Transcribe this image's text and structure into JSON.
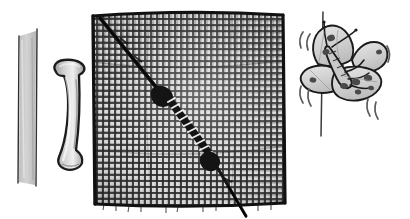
{
  "illustration": {
    "title": "Window screen repair with mesh, spline and butterfly",
    "style": "hand-drawn pen and ink with grayscale wash",
    "background_color": "#ffffff",
    "ink_color": "#1a1a1a",
    "canvas": {
      "width": 410,
      "height": 219
    }
  },
  "objects": {
    "spline_strip": {
      "name": "Spline strip",
      "label": "spline-strip",
      "description": "Narrow vertical flat strip with gray wash fill at far left",
      "fill_color": "#b9b9b9",
      "outline_color": "#2b2b2b",
      "x": 16,
      "y": 32,
      "width": 22,
      "height": 152
    },
    "spline_piece": {
      "name": "Curved spline piece",
      "label": "spline-curved-piece",
      "description": "Bent rubber spline / handle shaped like a curved bracket",
      "fill_color": "#c6c6c6",
      "highlight_color": "#e8e8e8",
      "outline_color": "#1e1e1e",
      "x": 52,
      "y": 60,
      "width": 34,
      "height": 110
    },
    "mesh_panel": {
      "name": "Screen mesh panel",
      "label": "mesh-screen-panel",
      "description": "Square woven insect screen mesh with fine grid weave",
      "mesh_color": "#2a2a2a",
      "gap_color": "#d7d7d7",
      "border_color": "#111111",
      "x": 92,
      "y": 13,
      "width": 192,
      "height": 192,
      "grid_pitch_px": 6,
      "columns": 32,
      "rows": 32
    },
    "repair_thread": {
      "name": "Repair thread and needle",
      "label": "repair-thread-stitch",
      "description": "Dark diagonal thread stitched through the mesh from upper-left to lower-right with whipped zigzag stitching at the middle",
      "thread_color": "#111111",
      "stitch_highlight_color": "#f2f2f2",
      "start_x": 100,
      "start_y": 18,
      "end_x": 246,
      "end_y": 216
    },
    "hanging_wire": {
      "name": "Vertical wire",
      "label": "vertical-wire-line",
      "description": "Thin vertical ink line behind the butterfly",
      "color": "#3a3a3a",
      "x": 322,
      "top_y": 12,
      "bottom_y": 136
    },
    "butterfly": {
      "name": "Butterfly",
      "label": "butterfly",
      "description": "Spotted butterfly perched on the wire with four patterned wings, body and two antennae",
      "wing_fill_color": "#dadada",
      "wing_shade_color": "#c2c2c2",
      "spot_color": "#4a4a4a",
      "outline_color": "#1b1b1b",
      "x": 300,
      "y": 22,
      "width": 86,
      "height": 78,
      "wing_count": 4,
      "spot_count": 10,
      "antenna_count": 2
    },
    "motion_marks": {
      "name": "Flutter motion marks",
      "label": "motion-lines",
      "description": "Short curved strokes around the butterfly indicating fluttering wings",
      "color": "#5a5a5a",
      "count": 5,
      "positions": [
        {
          "x": 300,
          "y": 38,
          "angle": -28
        },
        {
          "x": 306,
          "y": 42,
          "angle": -28
        },
        {
          "x": 300,
          "y": 88,
          "angle": 22
        },
        {
          "x": 307,
          "y": 92,
          "angle": 22
        },
        {
          "x": 386,
          "y": 52,
          "angle": 10
        },
        {
          "x": 368,
          "y": 98,
          "angle": 18
        },
        {
          "x": 374,
          "y": 102,
          "angle": 18
        }
      ]
    }
  }
}
